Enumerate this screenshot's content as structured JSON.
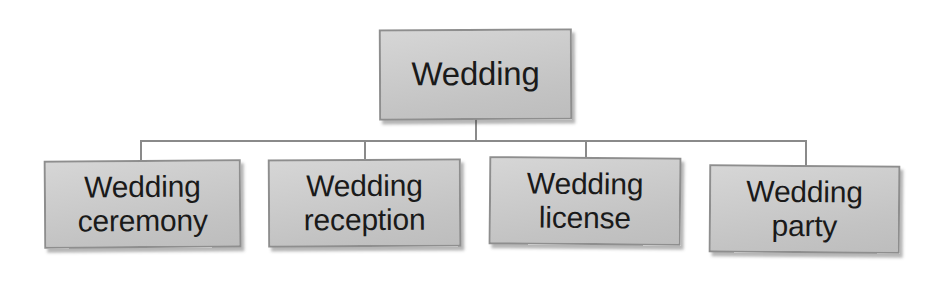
{
  "diagram": {
    "title_text": "Wedding hierarchy",
    "root": {
      "id": "root",
      "label": "Wedding"
    },
    "children": [
      {
        "id": "ceremony",
        "label": "Wedding\nceremony"
      },
      {
        "id": "reception",
        "label": "Wedding\nreception"
      },
      {
        "id": "license",
        "label": "Wedding\nlicense"
      },
      {
        "id": "party",
        "label": "Wedding\nparty"
      }
    ],
    "connectors": [
      {
        "id": "root-stem",
        "type": "vertical",
        "from": "root",
        "to": "bus"
      },
      {
        "id": "bus",
        "type": "horizontal",
        "from": "root",
        "to": "children"
      },
      {
        "id": "drop-1",
        "type": "vertical",
        "from": "bus",
        "to": "ceremony"
      },
      {
        "id": "drop-2",
        "type": "vertical",
        "from": "bus",
        "to": "reception"
      },
      {
        "id": "drop-3",
        "type": "vertical",
        "from": "bus",
        "to": "license"
      },
      {
        "id": "drop-4",
        "type": "vertical",
        "from": "bus",
        "to": "party"
      }
    ],
    "colors": {
      "background": "#ffffff",
      "box_fill": "#cbcbcb",
      "box_border": "#8e8e8e",
      "connector": "#8a8a8a",
      "text": "#1a1a1a"
    }
  }
}
